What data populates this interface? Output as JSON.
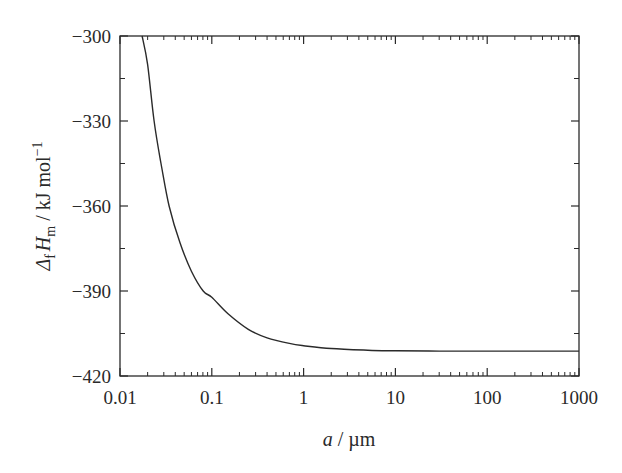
{
  "chart_data": {
    "type": "line",
    "title": "",
    "xlabel": "a / µm",
    "ylabel": "ΔfHm / kJ mol⁻¹",
    "xscale": "log",
    "xlim": [
      0.01,
      1000
    ],
    "ylim": [
      -420,
      -300
    ],
    "grid": false,
    "legend": null,
    "x_ticks": [
      0.01,
      0.1,
      1,
      10,
      100,
      1000
    ],
    "x_tick_labels": [
      "0.01",
      "0.1",
      "1",
      "10",
      "100",
      "1000"
    ],
    "y_ticks": [
      -300,
      -330,
      -360,
      -390,
      -420
    ],
    "y_tick_labels": [
      "−300",
      "−330",
      "−360",
      "−390",
      "−420"
    ],
    "y_minor_ticks": [
      -315,
      -345,
      -375,
      -405
    ],
    "series": [
      {
        "name": "ΔfHm",
        "color": "#2a2a2a",
        "x": [
          0.0174,
          0.02,
          0.0235,
          0.028,
          0.0343,
          0.045,
          0.06,
          0.0806,
          0.1,
          0.15,
          0.25,
          0.4,
          0.7,
          1,
          2,
          5,
          10,
          30,
          100,
          300,
          1000
        ],
        "y": [
          -300,
          -310,
          -330,
          -345,
          -360,
          -373,
          -383,
          -390,
          -392.2,
          -398,
          -403.5,
          -406.5,
          -408.5,
          -409.3,
          -410.3,
          -410.9,
          -411.1,
          -411.2,
          -411.2,
          -411.2,
          -411.2
        ]
      }
    ]
  },
  "axes": {
    "xlabel_italic": "a",
    "xlabel_rest": " / µm",
    "ylabel_delta": "Δ",
    "ylabel_sub_f": "f",
    "ylabel_H": "H",
    "ylabel_sub_m": "m",
    "ylabel_rest": " / kJ mol",
    "ylabel_sup": "−1"
  }
}
